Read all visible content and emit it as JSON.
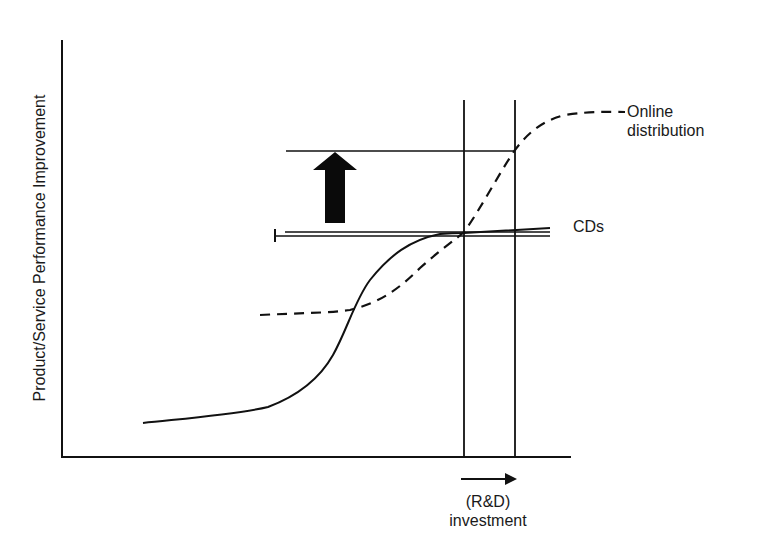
{
  "diagram": {
    "type": "s-curve-technology-substitution",
    "y_axis_label": "Product/Service Performance Improvement",
    "x_axis_label_line1": "(R&D)",
    "x_axis_label_line2": "investment",
    "curves": [
      {
        "name": "CDs",
        "label": "CDs",
        "style": "solid"
      },
      {
        "name": "Online distribution",
        "label_line1": "Online",
        "label_line2": "distribution",
        "style": "dashed"
      }
    ],
    "annotations": {
      "up_arrow": "performance jump",
      "x_arrow": "increasing investment"
    },
    "colors": {
      "line": "#111111",
      "background": "#ffffff"
    }
  }
}
